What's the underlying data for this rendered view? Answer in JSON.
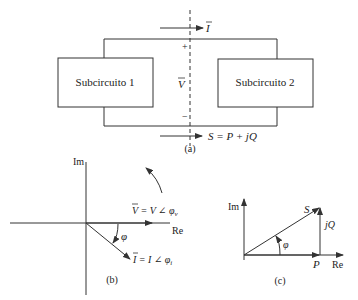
{
  "figure_a": {
    "subcircuit1_label": "Subcircuito 1",
    "subcircuit2_label": "Subcircuito 2",
    "current_label": "I",
    "voltage_label": "V",
    "plus_sign": "+",
    "minus_sign": "−",
    "power_label": "S = P + jQ",
    "caption": "(a)"
  },
  "figure_b": {
    "im_axis_label": "Im",
    "re_axis_label": "Re",
    "voltage_phasor_label": "V = V ∠ φ",
    "voltage_phasor_subscript": "v",
    "current_phasor_label": "I = I ∠ φ",
    "current_phasor_subscript": "i",
    "angle_label": "φ",
    "caption": "(b)"
  },
  "figure_c": {
    "im_axis_label": "Im",
    "re_axis_label": "Re",
    "s_label": "S",
    "jq_label": "jQ",
    "p_label": "P",
    "angle_label": "φ",
    "caption": "(c)"
  },
  "colors": {
    "stroke": "#333333",
    "background": "#ffffff"
  }
}
